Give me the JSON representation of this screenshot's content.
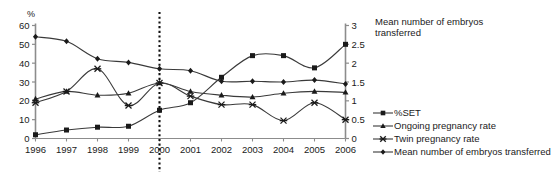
{
  "chart_data": {
    "type": "line",
    "title": "",
    "xlabel": "",
    "ylabel": "%",
    "y2label": "Mean number of embryos transferred",
    "categories": [
      "1996",
      "1997",
      "1998",
      "1999",
      "2000",
      "2001",
      "2002",
      "2003",
      "2004",
      "2005",
      "2006"
    ],
    "x": [
      1996,
      1997,
      1998,
      1999,
      2000,
      2001,
      2002,
      2003,
      2004,
      2005,
      2006
    ],
    "ylim": [
      0,
      60
    ],
    "y2lim": [
      0,
      3
    ],
    "yticks": [
      0,
      10,
      20,
      30,
      40,
      50,
      60
    ],
    "y2ticks": [
      0,
      0.5,
      1,
      1.5,
      2,
      2.5,
      3
    ],
    "grid": false,
    "legend_position": "right",
    "annotations": [
      {
        "type": "vline",
        "x": 2000,
        "style": "dotted",
        "label": ""
      }
    ],
    "series": [
      {
        "name": "%SET",
        "axis": "left",
        "marker": "square",
        "values": [
          2,
          4.5,
          6,
          6.5,
          15,
          19,
          32.5,
          44,
          44,
          37.5,
          50
        ]
      },
      {
        "name": "Ongoing pregnancy rate",
        "axis": "left",
        "marker": "triangle",
        "values": [
          21,
          25,
          23,
          24,
          29.5,
          25,
          23,
          22,
          24,
          25,
          24.5
        ]
      },
      {
        "name": "Twin pregnancy rate",
        "axis": "left",
        "marker": "cross",
        "values": [
          19,
          25,
          37,
          17.5,
          29.5,
          22.5,
          18,
          18,
          9.5,
          19,
          10
        ]
      },
      {
        "name": "Mean number of embryos transferred",
        "axis": "right",
        "marker": "diamond",
        "values": [
          2.7,
          2.58,
          2.12,
          2.02,
          1.85,
          1.8,
          1.52,
          1.52,
          1.5,
          1.55,
          1.45
        ]
      }
    ]
  },
  "axes": {
    "left_unit": "%",
    "right_title_line1": "Mean number of embryos",
    "right_title_line2": "transferred"
  },
  "legend": {
    "items": [
      {
        "label": "%SET",
        "marker": "square"
      },
      {
        "label": "Ongoing pregnancy rate",
        "marker": "triangle"
      },
      {
        "label": "Twin pregnancy rate",
        "marker": "cross"
      },
      {
        "label": "Mean number of embryos transferred",
        "marker": "diamond"
      }
    ]
  },
  "colors": {
    "line": "#3a3a3a",
    "axis": "#8c8c8c",
    "text": "#1a1a1a",
    "marker": "#1a1a1a"
  }
}
